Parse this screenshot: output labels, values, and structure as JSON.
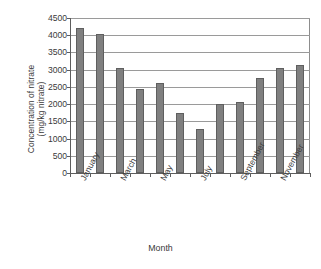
{
  "chart_data": {
    "type": "bar",
    "title": "",
    "xlabel": "Month",
    "ylabel_line1": "Concentration of nitrate",
    "ylabel_line2": "(mg/kg nitrate)",
    "categories": [
      "January",
      "February",
      "March",
      "April",
      "May",
      "June",
      "July",
      "August",
      "September",
      "October",
      "November",
      "December"
    ],
    "visible_tick_labels": [
      "January",
      "",
      "March",
      "",
      "May",
      "",
      "July",
      "",
      "September",
      "",
      "November",
      ""
    ],
    "values": [
      4210,
      4050,
      3050,
      2440,
      2620,
      1740,
      1290,
      2010,
      2050,
      2760,
      3050,
      3150
    ],
    "ylim": [
      0,
      4500
    ],
    "ytick_values": [
      0,
      500,
      1000,
      1500,
      2000,
      2500,
      3000,
      3500,
      4000,
      4500
    ],
    "ytick_labels": [
      "0",
      "500",
      "1000",
      "1500",
      "2000",
      "2500",
      "3000",
      "3500",
      "4000",
      "4500"
    ],
    "grid": true,
    "grid_axis": "y",
    "legend": false,
    "legend_position": "none",
    "series": [
      {
        "name": "Concentration of nitrate",
        "color": "#808080",
        "edge_color": "#5f5f5f",
        "values": [
          4210,
          4050,
          3050,
          2440,
          2620,
          1740,
          1290,
          2010,
          2050,
          2760,
          3050,
          3150
        ]
      }
    ]
  },
  "colors": {
    "bar_fill": "#808080",
    "bar_edge": "#5f5f5f",
    "gridline": "#9a9a9a",
    "axis": "#5d5d5d",
    "text": "#3a3a3a",
    "background": "#ffffff"
  }
}
